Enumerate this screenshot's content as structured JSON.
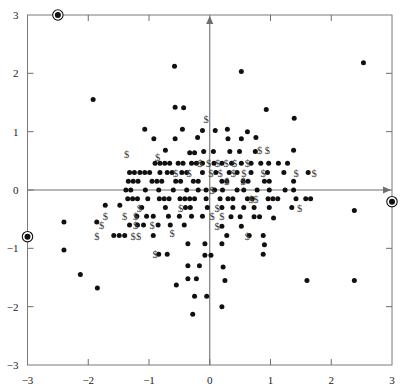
{
  "chart_data": {
    "type": "scatter",
    "title": "",
    "subtitle": "",
    "xlabel": "",
    "ylabel": "",
    "xlim": [
      -3,
      3
    ],
    "ylim": [
      -3,
      3
    ],
    "grid": false,
    "legend": null,
    "xticks": [
      -3,
      -2,
      -1,
      0,
      1,
      2,
      3
    ],
    "xticklabels": [
      "−3",
      "−2",
      "−1",
      "0",
      "1",
      "2",
      "3"
    ],
    "yticks": [
      -3,
      -2,
      -1,
      0,
      1,
      2,
      3
    ],
    "yticklabels": [
      "−3",
      "−2",
      "−1",
      "0",
      "1",
      "2",
      "3"
    ],
    "axes_through_origin": true,
    "frame": "box",
    "series": [
      {
        "name": "points",
        "marker": "filled-circle",
        "color": "#101010",
        "points": [
          [
            -1.92,
            1.55
          ],
          [
            -0.58,
            2.12
          ],
          [
            0.52,
            2.03
          ],
          [
            2.53,
            2.18
          ],
          [
            -0.57,
            1.42
          ],
          [
            -0.43,
            1.41
          ],
          [
            0.93,
            1.38
          ],
          [
            1.39,
            1.23
          ],
          [
            -1.07,
            1.04
          ],
          [
            -0.45,
            1.04
          ],
          [
            -0.12,
            1.02
          ],
          [
            0.09,
            1.02
          ],
          [
            0.29,
            1.04
          ],
          [
            0.62,
            1.0
          ],
          [
            -0.92,
            0.88
          ],
          [
            -0.57,
            0.88
          ],
          [
            -0.2,
            0.9
          ],
          [
            0.3,
            0.88
          ],
          [
            0.52,
            0.88
          ],
          [
            0.76,
            0.9
          ],
          [
            -0.73,
            0.68
          ],
          [
            -0.33,
            0.64
          ],
          [
            -0.25,
            0.64
          ],
          [
            -0.1,
            0.66
          ],
          [
            0.06,
            0.66
          ],
          [
            0.33,
            0.66
          ],
          [
            0.49,
            0.66
          ],
          [
            0.75,
            0.66
          ],
          [
            1.38,
            0.68
          ],
          [
            -0.9,
            0.46
          ],
          [
            -0.82,
            0.46
          ],
          [
            -0.74,
            0.46
          ],
          [
            -0.66,
            0.46
          ],
          [
            -0.52,
            0.46
          ],
          [
            -0.44,
            0.46
          ],
          [
            -0.3,
            0.46
          ],
          [
            -0.22,
            0.46
          ],
          [
            -0.12,
            0.46
          ],
          [
            0.07,
            0.46
          ],
          [
            0.2,
            0.46
          ],
          [
            0.36,
            0.46
          ],
          [
            0.52,
            0.46
          ],
          [
            0.68,
            0.46
          ],
          [
            0.84,
            0.46
          ],
          [
            0.97,
            0.46
          ],
          [
            1.13,
            0.46
          ],
          [
            1.28,
            0.46
          ],
          [
            -1.32,
            0.3
          ],
          [
            -1.24,
            0.3
          ],
          [
            -1.15,
            0.3
          ],
          [
            -1.07,
            0.3
          ],
          [
            -0.99,
            0.3
          ],
          [
            -0.82,
            0.3
          ],
          [
            -0.7,
            0.3
          ],
          [
            -0.62,
            0.3
          ],
          [
            -0.46,
            0.3
          ],
          [
            -0.38,
            0.3
          ],
          [
            -0.12,
            0.3
          ],
          [
            0.1,
            0.3
          ],
          [
            0.32,
            0.3
          ],
          [
            0.45,
            0.3
          ],
          [
            0.68,
            0.3
          ],
          [
            0.95,
            0.3
          ],
          [
            1.22,
            0.3
          ],
          [
            1.62,
            0.3
          ],
          [
            -1.34,
            0.15
          ],
          [
            -1.26,
            0.15
          ],
          [
            -1.18,
            0.15
          ],
          [
            -0.95,
            0.15
          ],
          [
            -0.87,
            0.15
          ],
          [
            -0.79,
            0.15
          ],
          [
            -0.56,
            0.15
          ],
          [
            -0.48,
            0.15
          ],
          [
            -0.27,
            0.15
          ],
          [
            -0.19,
            0.15
          ],
          [
            0.2,
            0.15
          ],
          [
            0.28,
            0.15
          ],
          [
            0.55,
            0.15
          ],
          [
            0.63,
            0.15
          ],
          [
            0.9,
            0.15
          ],
          [
            0.98,
            0.15
          ],
          [
            1.38,
            0.15
          ],
          [
            -1.38,
            0.0
          ],
          [
            -1.3,
            0.0
          ],
          [
            -1.06,
            0.0
          ],
          [
            -0.84,
            0.0
          ],
          [
            -0.6,
            0.0
          ],
          [
            -0.38,
            0.0
          ],
          [
            -0.19,
            0.0
          ],
          [
            -0.06,
            0.0
          ],
          [
            0.08,
            0.0
          ],
          [
            0.21,
            0.0
          ],
          [
            0.45,
            0.0
          ],
          [
            0.56,
            0.0
          ],
          [
            0.78,
            0.0
          ],
          [
            0.98,
            0.0
          ],
          [
            1.24,
            0.0
          ],
          [
            1.38,
            0.0
          ],
          [
            -1.35,
            -0.15
          ],
          [
            -1.27,
            -0.15
          ],
          [
            -1.19,
            -0.15
          ],
          [
            -1.02,
            -0.15
          ],
          [
            -0.83,
            -0.15
          ],
          [
            -0.75,
            -0.15
          ],
          [
            -0.67,
            -0.15
          ],
          [
            -0.49,
            -0.15
          ],
          [
            -0.41,
            -0.15
          ],
          [
            -0.33,
            -0.15
          ],
          [
            -0.25,
            -0.15
          ],
          [
            -0.06,
            -0.15
          ],
          [
            0.17,
            -0.15
          ],
          [
            0.3,
            -0.15
          ],
          [
            0.38,
            -0.15
          ],
          [
            0.62,
            -0.15
          ],
          [
            0.7,
            -0.15
          ],
          [
            0.96,
            -0.15
          ],
          [
            1.04,
            -0.15
          ],
          [
            1.12,
            -0.15
          ],
          [
            1.42,
            -0.15
          ],
          [
            1.58,
            -0.15
          ],
          [
            1.66,
            -0.15
          ],
          [
            -1.72,
            -0.26
          ],
          [
            -1.48,
            -0.26
          ],
          [
            -1.12,
            -0.3
          ],
          [
            -0.73,
            -0.3
          ],
          [
            -0.4,
            -0.3
          ],
          [
            -0.32,
            -0.3
          ],
          [
            -0.04,
            -0.3
          ],
          [
            0.2,
            -0.3
          ],
          [
            0.38,
            -0.3
          ],
          [
            0.56,
            -0.3
          ],
          [
            0.73,
            -0.3
          ],
          [
            0.98,
            -0.3
          ],
          [
            1.35,
            -0.3
          ],
          [
            -1.2,
            -0.45
          ],
          [
            -1.04,
            -0.45
          ],
          [
            -0.93,
            -0.45
          ],
          [
            -0.68,
            -0.45
          ],
          [
            -0.5,
            -0.45
          ],
          [
            -0.3,
            -0.45
          ],
          [
            -0.12,
            -0.45
          ],
          [
            0.35,
            -0.46
          ],
          [
            0.5,
            -0.46
          ],
          [
            0.73,
            -0.46
          ],
          [
            0.82,
            -0.46
          ],
          [
            1.05,
            -0.48
          ],
          [
            -2.4,
            -0.55
          ],
          [
            -1.86,
            -0.55
          ],
          [
            -1.32,
            -0.6
          ],
          [
            -1.19,
            -0.6
          ],
          [
            -1.09,
            -0.6
          ],
          [
            -0.85,
            -0.6
          ],
          [
            -0.65,
            -0.6
          ],
          [
            -0.42,
            -0.6
          ],
          [
            0.2,
            -0.62
          ],
          [
            0.52,
            -0.62
          ],
          [
            -1.58,
            -0.78
          ],
          [
            -1.49,
            -0.78
          ],
          [
            -1.4,
            -0.78
          ],
          [
            -0.93,
            -0.78
          ],
          [
            0.28,
            -0.78
          ],
          [
            0.65,
            -0.78
          ],
          [
            0.88,
            -0.78
          ],
          [
            -0.36,
            -0.92
          ],
          [
            -0.08,
            -0.92
          ],
          [
            0.2,
            -0.92
          ],
          [
            0.9,
            -0.94
          ],
          [
            -2.4,
            -1.03
          ],
          [
            -0.84,
            -1.1
          ],
          [
            -0.7,
            -1.1
          ],
          [
            -0.08,
            -1.12
          ],
          [
            0.02,
            -1.12
          ],
          [
            0.88,
            -1.1
          ],
          [
            -0.36,
            -1.3
          ],
          [
            -0.17,
            -1.3
          ],
          [
            0.22,
            -1.32
          ],
          [
            -2.13,
            -1.45
          ],
          [
            -0.36,
            -1.52
          ],
          [
            -0.22,
            -1.52
          ],
          [
            0.25,
            -1.55
          ],
          [
            -1.85,
            -1.68
          ],
          [
            -0.55,
            -1.63
          ],
          [
            1.6,
            -1.55
          ],
          [
            2.38,
            -1.55
          ],
          [
            -0.25,
            -1.82
          ],
          [
            -0.05,
            -1.82
          ],
          [
            0.2,
            -2.0
          ],
          [
            -0.28,
            -2.13
          ],
          [
            2.38,
            -0.35
          ]
        ]
      },
      {
        "name": "dollar-labels",
        "marker": "dollar-sign",
        "glyph": "$",
        "color": "#3d3d3d",
        "points": [
          [
            -0.06,
            1.22
          ],
          [
            -0.86,
            0.56
          ],
          [
            0.82,
            0.68
          ],
          [
            0.95,
            0.68
          ],
          [
            -0.16,
            0.46
          ],
          [
            -0.02,
            0.46
          ],
          [
            0.13,
            0.46
          ],
          [
            0.27,
            0.46
          ],
          [
            0.41,
            0.46
          ],
          [
            0.62,
            0.46
          ],
          [
            1.42,
            0.3
          ],
          [
            1.72,
            0.3
          ],
          [
            -1.37,
            0.62
          ],
          [
            -0.56,
            0.3
          ],
          [
            -0.34,
            0.3
          ],
          [
            0.02,
            0.3
          ],
          [
            0.17,
            0.3
          ],
          [
            0.39,
            0.3
          ],
          [
            0.56,
            0.3
          ],
          [
            0.88,
            0.3
          ],
          [
            0.28,
            0.15
          ],
          [
            0.55,
            0.15
          ],
          [
            0.04,
            0.0
          ],
          [
            0.68,
            -0.15
          ],
          [
            0.76,
            -0.15
          ],
          [
            1.48,
            -0.3
          ],
          [
            -1.16,
            -0.3
          ],
          [
            -0.48,
            -0.3
          ],
          [
            0.12,
            -0.3
          ],
          [
            -1.72,
            -0.45
          ],
          [
            -1.4,
            -0.45
          ],
          [
            -1.22,
            -0.45
          ],
          [
            0.04,
            -0.45
          ],
          [
            0.2,
            -0.45
          ],
          [
            -1.78,
            -0.6
          ],
          [
            -1.22,
            -0.6
          ],
          [
            -0.95,
            -0.6
          ],
          [
            0.12,
            -0.62
          ],
          [
            -1.86,
            -0.78
          ],
          [
            -1.26,
            -0.78
          ],
          [
            -1.17,
            -0.78
          ],
          [
            -0.62,
            -0.74
          ],
          [
            0.62,
            -0.78
          ],
          [
            -0.9,
            -1.1
          ]
        ]
      },
      {
        "name": "highlighted-boundary-points",
        "marker": "circled-dot",
        "color": "#101010",
        "points": [
          [
            -2.5,
            3.0
          ],
          [
            -3.0,
            -0.8
          ],
          [
            3.0,
            -0.2
          ]
        ]
      }
    ]
  },
  "axis": {
    "x_axis_name": "horizontal-axis",
    "y_axis_name": "vertical-axis",
    "arrow_heads": true
  }
}
